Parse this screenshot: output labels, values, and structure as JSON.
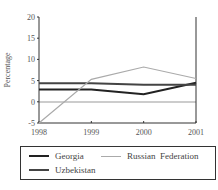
{
  "chart_data": {
    "type": "line",
    "title": "",
    "xlabel": "",
    "ylabel": "Percentage",
    "x": [
      "1998",
      "1999",
      "2000",
      "2001"
    ],
    "ylim": [
      -5,
      20
    ],
    "yticks": [
      "20",
      "15",
      "10",
      "5",
      "0",
      "-5"
    ],
    "grid": false,
    "legend_position": "bottom",
    "series": [
      {
        "name": "Georgia",
        "color": "#222222",
        "values": [
          2.9,
          2.9,
          1.8,
          4.5
        ]
      },
      {
        "name": "Uzbekistan",
        "color": "#444444",
        "values": [
          4.4,
          4.4,
          4.0,
          4.0
        ]
      },
      {
        "name": "Russian Federation",
        "color": "#aaaaaa",
        "values": [
          -5.0,
          5.3,
          8.2,
          5.5
        ]
      }
    ]
  },
  "legend": {
    "georgia": "Georgia",
    "uzbekistan": "Uzbekistan",
    "russia": "Russian  Federation"
  }
}
